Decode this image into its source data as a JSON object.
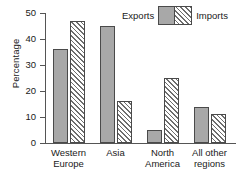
{
  "chart_data": {
    "type": "bar",
    "title": "",
    "xlabel": "",
    "ylabel": "Percentage",
    "ylim": [
      0,
      50
    ],
    "yticks": [
      0,
      10,
      20,
      30,
      40,
      50
    ],
    "grid": false,
    "legend_position": "top-center",
    "categories": [
      "Western\nEurope",
      "Asia",
      "North\nAmerica",
      "All other\nregions"
    ],
    "series": [
      {
        "name": "Exports",
        "values": [
          36,
          45,
          5,
          14
        ],
        "color": "#a8a8a8",
        "pattern": "solid"
      },
      {
        "name": "Imports",
        "values": [
          47,
          16,
          25,
          11
        ],
        "color": "#ffffff",
        "pattern": "diagonal-hatch"
      }
    ]
  },
  "legend": {
    "exports_label": "Exports",
    "imports_label": "Imports"
  },
  "axis": {
    "y_title": "Percentage",
    "ticks": [
      "50",
      "40",
      "30",
      "20",
      "10",
      "0"
    ]
  }
}
